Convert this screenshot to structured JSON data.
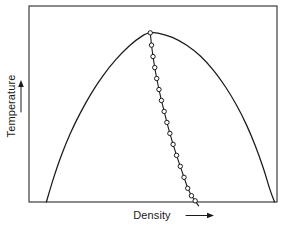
{
  "figure": {
    "background_color": "#ffffff",
    "line_color": "#1a1a1a",
    "frame_color": "#2b2b2b"
  },
  "axes": {
    "y_label": "Temperature",
    "y_arrow_icon": "arrow-up-icon",
    "x_label": "Density",
    "x_arrow_icon": "arrow-right-icon",
    "frame": {
      "left": 29,
      "top": 6,
      "right": 277,
      "bottom": 202
    },
    "ticks": [],
    "tick_labels": [],
    "grid": false
  },
  "chart_data": {
    "type": "line",
    "title": "",
    "xlabel": "Density",
    "ylabel": "Temperature",
    "xlim": [
      0,
      1
    ],
    "ylim": [
      0,
      1
    ],
    "grid": false,
    "legend": null,
    "series": [
      {
        "name": "coexistence-dome",
        "style": "smooth-curve",
        "markers": false,
        "comment": "Inverted parabola-like phase envelope spanning the frame",
        "x": [
          0.07,
          0.098,
          0.13,
          0.166,
          0.206,
          0.25,
          0.298,
          0.35,
          0.404,
          0.46,
          0.489,
          0.52,
          0.578,
          0.636,
          0.692,
          0.744,
          0.792,
          0.836,
          0.876,
          0.912,
          0.944,
          0.972,
          0.99
        ],
        "y": [
          0.0,
          0.118,
          0.236,
          0.348,
          0.452,
          0.552,
          0.644,
          0.726,
          0.796,
          0.85,
          0.863,
          0.862,
          0.84,
          0.8,
          0.744,
          0.672,
          0.588,
          0.496,
          0.396,
          0.288,
          0.176,
          0.062,
          0.0
        ]
      },
      {
        "name": "isochore-data",
        "style": "straight-line-with-markers",
        "markers": true,
        "marker_shape": "open-circle",
        "marker_count": 17,
        "comment": "Steep near-vertical data line from dome apex down through bottom axis",
        "x": [
          0.489,
          0.494,
          0.5,
          0.507,
          0.515,
          0.524,
          0.534,
          0.545,
          0.556,
          0.568,
          0.581,
          0.595,
          0.61,
          0.625,
          0.64,
          0.655,
          0.67,
          0.684
        ],
        "y": [
          0.863,
          0.8,
          0.742,
          0.686,
          0.63,
          0.574,
          0.518,
          0.462,
          0.406,
          0.35,
          0.294,
          0.238,
          0.182,
          0.126,
          0.07,
          0.032,
          0.006,
          -0.02
        ]
      }
    ]
  }
}
